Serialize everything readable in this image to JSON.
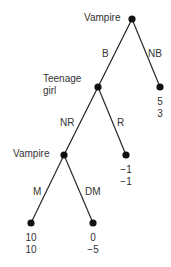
{
  "diagram": {
    "type": "game-tree",
    "nodes": [
      {
        "id": "root",
        "player": "Vampire",
        "x": 132,
        "y": 19
      },
      {
        "id": "n_girl",
        "player": "Teenage girl",
        "player_lines": [
          "Teenage",
          "girl"
        ],
        "x": 98,
        "y": 87
      },
      {
        "id": "leaf_NB",
        "x": 160,
        "y": 87,
        "payoffs": [
          "5",
          "3"
        ]
      },
      {
        "id": "n_vamp2",
        "player": "Vampire",
        "x": 64,
        "y": 155
      },
      {
        "id": "leaf_R",
        "x": 126,
        "y": 155,
        "payoffs": [
          "−1",
          "−1"
        ]
      },
      {
        "id": "leaf_M",
        "x": 31,
        "y": 223,
        "payoffs": [
          "10",
          "10"
        ]
      },
      {
        "id": "leaf_DM",
        "x": 93,
        "y": 223,
        "payoffs": [
          "0",
          "−5"
        ]
      }
    ],
    "edges": [
      {
        "from": "root",
        "to": "n_girl",
        "label": "B"
      },
      {
        "from": "root",
        "to": "leaf_NB",
        "label": "NB"
      },
      {
        "from": "n_girl",
        "to": "n_vamp2",
        "label": "NR"
      },
      {
        "from": "n_girl",
        "to": "leaf_R",
        "label": "R"
      },
      {
        "from": "n_vamp2",
        "to": "leaf_M",
        "label": "M"
      },
      {
        "from": "n_vamp2",
        "to": "leaf_DM",
        "label": "DM"
      }
    ]
  },
  "labels": {
    "root_player": "Vampire",
    "girl_player_line1": "Teenage",
    "girl_player_line2": "girl",
    "vamp2_player": "Vampire",
    "edge_B": "B",
    "edge_NB": "NB",
    "edge_NR": "NR",
    "edge_R": "R",
    "edge_M": "M",
    "edge_DM": "DM",
    "payoff_NB_1": "5",
    "payoff_NB_2": "3",
    "payoff_R_1": "−1",
    "payoff_R_2": "−1",
    "payoff_M_1": "10",
    "payoff_M_2": "10",
    "payoff_DM_1": "0",
    "payoff_DM_2": "−5"
  }
}
